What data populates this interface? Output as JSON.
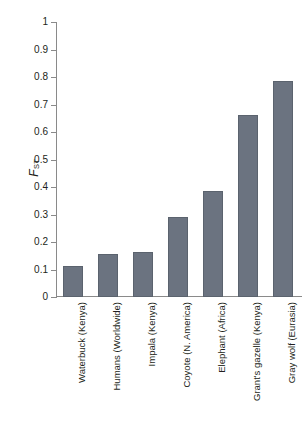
{
  "chart_data": {
    "type": "bar",
    "title": "",
    "xlabel": "",
    "ylabel": "FST",
    "ylabel_main": "F",
    "ylabel_sub": "ST",
    "ylim": [
      0,
      1
    ],
    "grid": false,
    "legend": "none",
    "bar_color": "#6b7380",
    "axis_color": "#8a8a8a",
    "categories": [
      "Waterbuck (Kenya)",
      "Humans (Worldwide)",
      "Impala (Kenya)",
      "Coyote (N. America)",
      "Elephant (Africa)",
      "Grant's gazelle (Kenya)",
      "Gray wolf (Eurasia)"
    ],
    "values": [
      0.113,
      0.156,
      0.164,
      0.29,
      0.385,
      0.662,
      0.785
    ],
    "ytick_labels": [
      "1",
      "0.9",
      "0.8",
      "0.7",
      "0.6",
      "0.5",
      "0.4",
      "0.3",
      "0.2",
      "0.1",
      "0"
    ],
    "ytick_values": [
      1,
      0.9,
      0.8,
      0.7,
      0.6,
      0.5,
      0.4,
      0.3,
      0.2,
      0.1,
      0
    ]
  }
}
